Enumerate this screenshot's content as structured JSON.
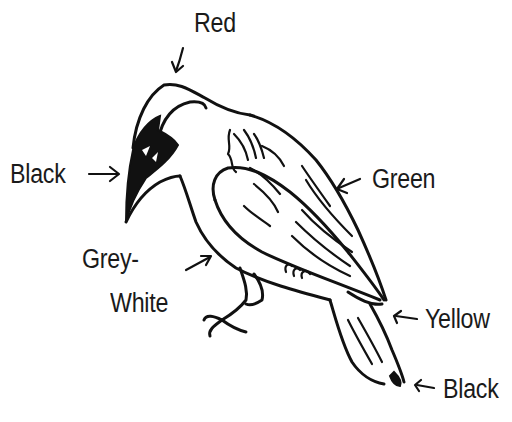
{
  "diagram": {
    "labels": {
      "crown": "Red",
      "face": "Black",
      "wing": "Green",
      "belly_line1": "Grey-",
      "belly_line2": "White",
      "rump": "Yellow",
      "tail": "Black"
    },
    "colors": {
      "ink": "#111111",
      "background": "#ffffff"
    }
  }
}
